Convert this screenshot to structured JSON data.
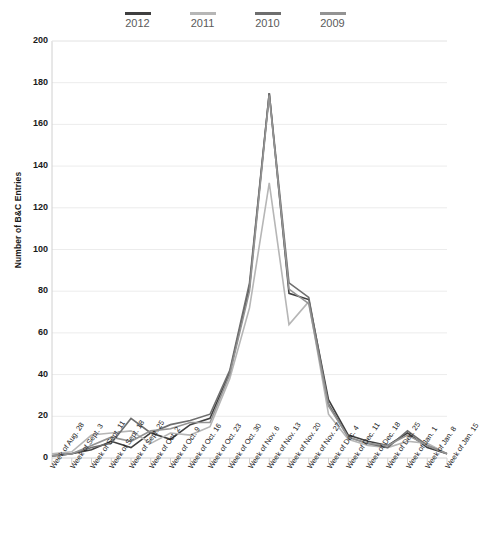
{
  "chart_data": {
    "type": "line",
    "title": "",
    "xlabel": "",
    "ylabel": "Number of B&C Entries",
    "ylim": [
      0,
      200
    ],
    "ytick_step": 20,
    "yticks": [
      200,
      180,
      160,
      140,
      120,
      100,
      80,
      60,
      40,
      20,
      0
    ],
    "grid": true,
    "legend_position": "top",
    "categories": [
      "Week of Aug. 28",
      "Week of Sept. 3",
      "Week of Sept. 11",
      "Week of Sept. 18",
      "Week of Sept. 25",
      "Week of Oct. 2",
      "Week of Oct. 9",
      "Week of Oct. 16",
      "Week of Oct. 23",
      "Week of Oct. 30",
      "Week of Nov. 6",
      "Week of Nov. 13",
      "Week of Nov. 20",
      "Week of Nov. 27",
      "Week of Dec. 4",
      "Week of Dec. 11",
      "Week of Dec. 18",
      "Week of Dec. 25",
      "Week of Jan. 1",
      "Week of Jan. 8",
      "Week of Jan. 15"
    ],
    "series": [
      {
        "name": "2012",
        "color": "#3f3f3f",
        "values": [
          1,
          2,
          4,
          8,
          5,
          12,
          9,
          16,
          19,
          41,
          82,
          175,
          79,
          76,
          28,
          11,
          8,
          6,
          12,
          5,
          2
        ]
      },
      {
        "name": "2011",
        "color": "#b6b6b6",
        "values": [
          2,
          3,
          11,
          12,
          13,
          7,
          12,
          11,
          15,
          38,
          72,
          132,
          64,
          75,
          21,
          9,
          6,
          5,
          8,
          7,
          2
        ]
      },
      {
        "name": "2010",
        "color": "#6e6e6e",
        "values": [
          1,
          2,
          5,
          7,
          19,
          12,
          16,
          18,
          21,
          42,
          84,
          175,
          84,
          77,
          26,
          10,
          7,
          5,
          13,
          6,
          2
        ]
      },
      {
        "name": "2009",
        "color": "#939393",
        "values": [
          1,
          2,
          6,
          10,
          8,
          13,
          14,
          17,
          17,
          40,
          80,
          174,
          81,
          74,
          25,
          10,
          7,
          6,
          11,
          6,
          2
        ]
      }
    ]
  },
  "legend": {
    "items": [
      {
        "label": "2012",
        "color": "#3f3f3f"
      },
      {
        "label": "2011",
        "color": "#b6b6b6"
      },
      {
        "label": "2010",
        "color": "#6e6e6e"
      },
      {
        "label": "2009",
        "color": "#939393"
      }
    ]
  },
  "axes": {
    "y_title": "Number of B&C Entries",
    "axis_color": "#d0d0d0",
    "grid_color": "#ececec",
    "tick_text_color": "#1a1a1a"
  }
}
